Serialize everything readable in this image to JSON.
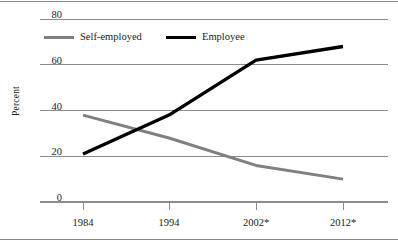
{
  "chart_data": {
    "type": "line",
    "title": "",
    "subtitle": "",
    "xlabel": "",
    "ylabel": "Percent",
    "categories": [
      "1984",
      "1994",
      "2002*",
      "2012*"
    ],
    "series": [
      {
        "name": "Self-employed",
        "color": "#808080",
        "values": [
          38,
          28,
          16,
          10
        ]
      },
      {
        "name": "Employee",
        "color": "#000000",
        "values": [
          21,
          38,
          62,
          68
        ]
      }
    ],
    "ylim": [
      0,
      80
    ],
    "yticks": [
      0,
      20,
      40,
      60,
      80
    ],
    "ytick_labels": [
      "0",
      "20",
      "40",
      "60",
      "80"
    ],
    "grid": true,
    "grid_color": "#8c8c8c",
    "legend_position": "top-left-inside",
    "annotations": []
  },
  "legend": {
    "entries": [
      {
        "label": "Self-employed",
        "swatch_color": "#808080"
      },
      {
        "label": "Employee",
        "swatch_color": "#000000"
      }
    ]
  },
  "axis": {
    "y_title": "Percent",
    "y_tick_labels": [
      "80",
      "60",
      "40",
      "20",
      "0"
    ],
    "x_tick_labels": [
      "1984",
      "1994",
      "2002*",
      "2012*"
    ]
  },
  "figure": {
    "rule_color": "#8a8a8a"
  }
}
